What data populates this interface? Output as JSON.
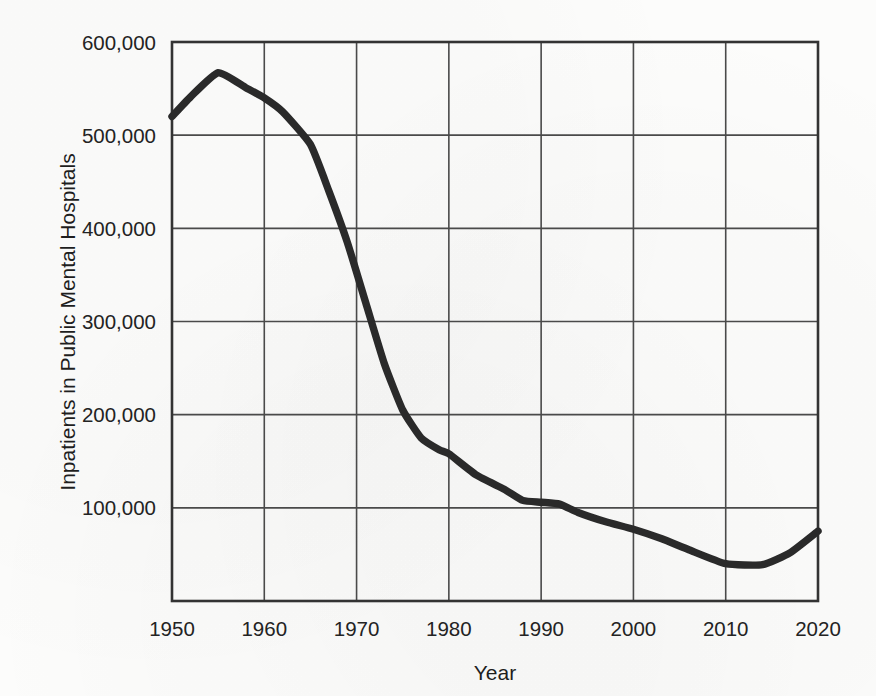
{
  "chart_data": {
    "type": "line",
    "title": "",
    "xlabel": "Year",
    "ylabel": "Inpatients in Public Mental Hospitals",
    "xlim": [
      1950,
      2020
    ],
    "ylim": [
      0,
      600000
    ],
    "grid": true,
    "legend": "none",
    "x_ticks": [
      "1950",
      "1960",
      "1970",
      "1980",
      "1990",
      "2000",
      "2010",
      "2020"
    ],
    "x_tick_values": [
      1950,
      1960,
      1970,
      1980,
      1990,
      2000,
      2010,
      2020
    ],
    "y_ticks": [
      "100,000",
      "200,000",
      "300,000",
      "400,000",
      "500,000",
      "600,000"
    ],
    "y_tick_values": [
      100000,
      200000,
      300000,
      400000,
      500000,
      600000
    ],
    "series": [
      {
        "name": "Inpatients in Public Mental Hospitals",
        "color": "#2a2a2a",
        "x": [
          1950,
          1952,
          1955,
          1958,
          1960,
          1962,
          1965,
          1967,
          1969,
          1971,
          1973,
          1975,
          1977,
          1979,
          1980,
          1983,
          1986,
          1988,
          1990,
          1992,
          1994,
          1997,
          2000,
          2003,
          2006,
          2010,
          2014,
          2017,
          2020
        ],
        "values": [
          520000,
          541000,
          567000,
          551000,
          540000,
          525000,
          490000,
          440000,
          385000,
          320000,
          255000,
          205000,
          175000,
          162000,
          158000,
          135000,
          120000,
          108000,
          106000,
          104000,
          95000,
          85000,
          77000,
          67000,
          55000,
          40000,
          39000,
          52000,
          75000
        ]
      }
    ]
  },
  "axes": {
    "x_title": "Year",
    "y_title": "Inpatients in Public Mental Hospitals"
  }
}
